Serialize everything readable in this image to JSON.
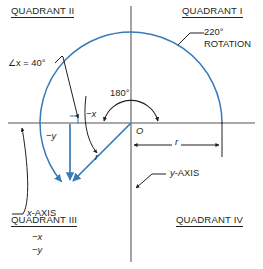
{
  "diagram": {
    "title_quadrants": {
      "q1": "QUADRANT I",
      "q2": "QUADRANT II",
      "q3": "QUADRANT III",
      "q4": "QUADRANT IV"
    },
    "quadrant3_components": {
      "neg_x": "−x",
      "neg_y": "−y"
    },
    "annotations": {
      "rotation_value": "220°",
      "rotation_word": "ROTATION",
      "reference_angle": "∠x = 40°",
      "straight_angle": "180°",
      "neg_x_component": "−x",
      "neg_y_component": "−y",
      "radius": "r",
      "radius_dimension": "r",
      "origin": "O",
      "x_axis_label": "x-AXIS",
      "y_axis_label": "y-AXIS"
    },
    "colors": {
      "accent_blue": "#3a7ab5",
      "ink": "#231f20",
      "axis_gray": "#8d8d8d",
      "background": "#ffffff"
    },
    "geometry": {
      "origin_x": 131,
      "origin_y": 123,
      "radius_px": 91,
      "arc_start_deg": 0,
      "arc_end_deg": 220,
      "terminal_point_x": 70,
      "terminal_point_y": 184
    }
  }
}
